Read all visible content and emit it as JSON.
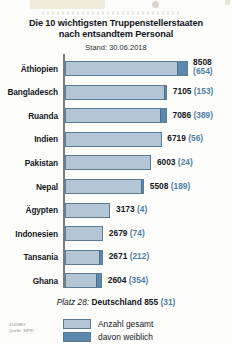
{
  "title": {
    "line1": "Die 10 wichtigsten Truppenstellerstaaten",
    "line2": "nach entsandtem Personal",
    "subtitle": "Stand: 30.06.2018"
  },
  "germany_note": {
    "rank": "Platz 28:",
    "country": "Deutschland",
    "total": "855",
    "female": "(31)"
  },
  "legend": {
    "total_label": "Anzahl gesamt",
    "female_label": "davon weiblich"
  },
  "credits": {
    "id": "41459EX",
    "source": "Quelle: SIPRI"
  },
  "colors": {
    "bar_total": "#b3c6d6",
    "bar_female": "#5b89ae",
    "bar_outline": "#5d7b92",
    "female_text": "#4f7fa6",
    "axis": "#7c7c7c"
  },
  "chart_data": {
    "type": "bar",
    "title": "Die 10 wichtigsten Truppenstellerstaaten nach entsandtem Personal",
    "subtitle": "Stand: 30.06.2018",
    "orientation": "horizontal",
    "xlabel": "",
    "ylabel": "",
    "xlim": [
      0,
      8508
    ],
    "grid": false,
    "legend_position": "bottom",
    "categories": [
      "Äthiopien",
      "Bangladesch",
      "Ruanda",
      "Indien",
      "Pakistan",
      "Nepal",
      "Ägypten",
      "Indonesien",
      "Tansania",
      "Ghana"
    ],
    "series": [
      {
        "name": "Anzahl gesamt",
        "values": [
          8508,
          7105,
          7086,
          6719,
          6003,
          5508,
          3173,
          2679,
          2671,
          2604
        ]
      },
      {
        "name": "davon weiblich",
        "values": [
          654,
          153,
          389,
          56,
          24,
          189,
          4,
          74,
          212,
          354
        ]
      }
    ],
    "rows": [
      {
        "category": "Äthiopien",
        "total": 8508,
        "female": 654,
        "total_label": "8508",
        "female_label": "(654)",
        "wrap": true
      },
      {
        "category": "Bangladesch",
        "total": 7105,
        "female": 153,
        "total_label": "7105",
        "female_label": "(153)",
        "wrap": false
      },
      {
        "category": "Ruanda",
        "total": 7086,
        "female": 389,
        "total_label": "7086",
        "female_label": "(389)",
        "wrap": false
      },
      {
        "category": "Indien",
        "total": 6719,
        "female": 56,
        "total_label": "6719",
        "female_label": "(56)",
        "wrap": false
      },
      {
        "category": "Pakistan",
        "total": 6003,
        "female": 24,
        "total_label": "6003",
        "female_label": "(24)",
        "wrap": false
      },
      {
        "category": "Nepal",
        "total": 5508,
        "female": 189,
        "total_label": "5508",
        "female_label": "(189)",
        "wrap": false
      },
      {
        "category": "Ägypten",
        "total": 3173,
        "female": 4,
        "total_label": "3173",
        "female_label": "(4)",
        "wrap": false
      },
      {
        "category": "Indonesien",
        "total": 2679,
        "female": 74,
        "total_label": "2679",
        "female_label": "(74)",
        "wrap": false
      },
      {
        "category": "Tansania",
        "total": 2671,
        "female": 212,
        "total_label": "2671",
        "female_label": "(212)",
        "wrap": false
      },
      {
        "category": "Ghana",
        "total": 2604,
        "female": 354,
        "total_label": "2604",
        "female_label": "(354)",
        "wrap": false
      }
    ],
    "annotation": "Platz 28: Deutschland 855 (31)"
  }
}
